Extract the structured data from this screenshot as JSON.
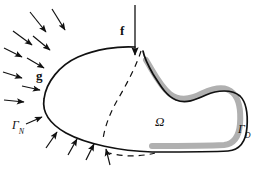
{
  "figure": {
    "type": "diagram",
    "width": 266,
    "height": 174,
    "background_color": "#ffffff"
  },
  "colors": {
    "outline": "#111111",
    "dashed": "#111111",
    "dirichlet_band": "#b0b0b0",
    "arrow": "#111111",
    "text": "#111111"
  },
  "labels": {
    "load": {
      "text": "f",
      "name": "applied-load",
      "x": 120,
      "y": 24
    },
    "traction": {
      "text": "g",
      "name": "surface-traction",
      "x": 36,
      "y": 69
    },
    "domain": {
      "text": "Ω",
      "name": "domain-omega",
      "x": 155,
      "y": 115
    },
    "neumann": {
      "gamma": "Γ",
      "sub": "N",
      "name": "neumann-boundary",
      "x": 12,
      "y": 119
    },
    "dirichlet": {
      "gamma": "Γ",
      "sub": "D",
      "name": "dirichlet-boundary",
      "x": 238,
      "y": 123
    }
  },
  "geometry": {
    "body_outline": "M 135 47 C 118 46 96 49 78 57 C 60 65 46 82 44 99 C 42 112 50 124 66 133 C 86 144 120 151 152 152 C 183 152 212 152 228 151 C 240 150 246 141 247 127 C 248 113 246 102 240 96 C 232 89 217 90 206 95 C 195 100 186 104 176 100 C 166 96 160 85 153 74 C 149 67 144 56 143 51",
    "dirichlet_band": "M 146 60 C 154 73 160 86 170 94 C 180 102 192 99 203 93 C 214 88 226 86 233 93 C 239 99 241 110 240 124 C 239 136 234 144 224 145 C 206 146 178 146 152 146",
    "dashed_crease": "M 141 51 C 137 64 128 82 118 99 C 110 113 105 126 103 139",
    "dashed_bottom": "M 106 152 C 120 157 140 157 155 153",
    "load_arrow": {
      "x1": 135,
      "y1": 5,
      "x2": 135,
      "y2": 55
    }
  },
  "traction_arrows": [
    {
      "x1": 30,
      "y1": 12,
      "x2": 46,
      "y2": 32
    },
    {
      "x1": 52,
      "y1": 9,
      "x2": 65,
      "y2": 30
    },
    {
      "x1": 13,
      "y1": 31,
      "x2": 32,
      "y2": 45
    },
    {
      "x1": 33,
      "y1": 36,
      "x2": 50,
      "y2": 50
    },
    {
      "x1": 4,
      "y1": 48,
      "x2": 22,
      "y2": 57
    },
    {
      "x1": 27,
      "y1": 58,
      "x2": 44,
      "y2": 68
    },
    {
      "x1": 3,
      "y1": 72,
      "x2": 22,
      "y2": 78
    },
    {
      "x1": 22,
      "y1": 86,
      "x2": 40,
      "y2": 90
    },
    {
      "x1": 4,
      "y1": 100,
      "x2": 24,
      "y2": 102
    },
    {
      "x1": 26,
      "y1": 124,
      "x2": 42,
      "y2": 117
    },
    {
      "x1": 46,
      "y1": 148,
      "x2": 57,
      "y2": 132
    },
    {
      "x1": 68,
      "y1": 155,
      "x2": 77,
      "y2": 139
    },
    {
      "x1": 86,
      "y1": 160,
      "x2": 94,
      "y2": 144
    },
    {
      "x1": 110,
      "y1": 165,
      "x2": 106,
      "y2": 149
    }
  ]
}
